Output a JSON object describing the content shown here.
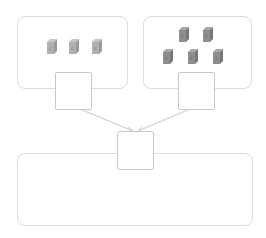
{
  "diagram": {
    "type": "addition-blocks",
    "left_group": {
      "block_count": 3,
      "block_letter": "c",
      "color": "#a9a9a9",
      "answer_box": ""
    },
    "right_group": {
      "block_count": 5,
      "block_letter": "c",
      "color": "#8a8a8a",
      "answer_box": ""
    },
    "total_box": "",
    "result_area": ""
  },
  "colors": {
    "border": "#dcdcdc",
    "square_border": "#c8c8c8",
    "line": "#cfcfcf"
  }
}
